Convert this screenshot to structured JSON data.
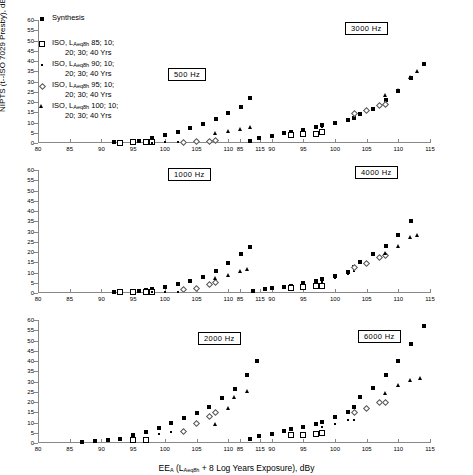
{
  "figure": {
    "ylabel": "NIPTS (t--ISO 7029 Presby), dB",
    "xlabel_main": "EE",
    "xlabel_sub_a": "A",
    "xlabel_rest": " (L",
    "xlabel_sub_b": "Aeq8h",
    "xlabel_tail": " + 8 Log Years Exposure), dBy"
  },
  "legend": {
    "items": [
      {
        "marker": "filled-square",
        "line1": "Synthesis",
        "line2": ""
      },
      {
        "marker": "open-square",
        "line1_pre": "ISO,  L",
        "line1_sub": "Aeq8h",
        "line1_post": "  85;  10;",
        "line2": "20;  30;  40  Yrs"
      },
      {
        "marker": "small-dot",
        "line1_pre": "ISO,  L",
        "line1_sub": "Aeq8h",
        "line1_post": "  90;  10;",
        "line2": "20;  30;  40  Yrs"
      },
      {
        "marker": "open-diamond",
        "line1_pre": "ISO,  L",
        "line1_sub": "Aeq8h",
        "line1_post": "  95;  10;",
        "line2": "20;  30;  40  Yrs"
      },
      {
        "marker": "filled-triangle",
        "line1_pre": "ISO,  L",
        "line1_sub": "Aeq8h",
        "line1_post": "  100;  10;",
        "line2": "20;  30;  40  Yrs"
      }
    ]
  },
  "chart_data": {
    "type": "scatter",
    "title": "",
    "xlabel": "EE_A (L_Aeq8h + 8 Log Years Exposure), dBy",
    "ylabel": "NIPTS (t--ISO 7029 Presby), dB",
    "ylim": [
      0,
      60
    ],
    "yticks": [
      0,
      5,
      10,
      15,
      20,
      25,
      30,
      35,
      40,
      45,
      50,
      55,
      60
    ],
    "grid": false,
    "legend_position": "top-left",
    "panels": [
      {
        "label": "500  Hz",
        "row": 0,
        "col": 0,
        "xlim": [
          80,
          115
        ],
        "xticks": [
          80,
          85,
          90,
          95,
          100,
          105,
          110,
          115
        ],
        "series": [
          {
            "name": "Synthesis",
            "marker": "filled-square",
            "x": [
              92,
              93,
              95,
              96,
              97,
              98,
              100,
              102,
              104,
              106,
              108,
              110,
              112,
              113.5
            ],
            "y": [
              0.3,
              0.4,
              0.6,
              0.8,
              1.2,
              2.6,
              3.8,
              5.3,
              7.2,
              9.2,
              11.7,
              14.7,
              17.6,
              22.0
            ]
          },
          {
            "name": "ISO 85",
            "marker": "open-square",
            "x": [
              93,
              95,
              97,
              98
            ],
            "y": [
              0.2,
              0.3,
              0.3,
              0.4
            ]
          },
          {
            "name": "ISO 90",
            "marker": "small-dot",
            "x": [
              98,
              100,
              102,
              103,
              105
            ],
            "y": [
              0.2,
              0.3,
              0.3,
              0.4,
              0.4
            ]
          },
          {
            "name": "ISO 95",
            "marker": "open-diamond",
            "x": [
              103,
              105,
              107,
              108
            ],
            "y": [
              0.4,
              0.5,
              0.7,
              1.0
            ]
          },
          {
            "name": "ISO 100",
            "marker": "filled-triangle",
            "x": [
              108,
              110,
              112,
              113.5
            ],
            "y": [
              4.3,
              5.1,
              6.1,
              7.2
            ]
          }
        ]
      },
      {
        "label": "3000  Hz",
        "row": 0,
        "col": 1,
        "xlim": [
          85,
          115
        ],
        "xticks": [
          85,
          90,
          95,
          100,
          105,
          110,
          115
        ],
        "series": [
          {
            "name": "Synthesis",
            "marker": "filled-square",
            "x": [
              86.5,
              88,
              90,
              92,
              93,
              95,
              97,
              98,
              100,
              102,
              103,
              104,
              106,
              108,
              110,
              112,
              114
            ],
            "y": [
              1.2,
              2.3,
              3.6,
              4.7,
              5.2,
              6.4,
              7.6,
              8.7,
              9.8,
              11.0,
              12.0,
              14.2,
              16.8,
              21.2,
              25.3,
              31.7,
              38.4
            ]
          },
          {
            "name": "ISO 85",
            "marker": "open-square",
            "x": [
              93,
              95,
              97,
              98
            ],
            "y": [
              3.7,
              4.3,
              4.6,
              5.2
            ]
          },
          {
            "name": "ISO 90",
            "marker": "small-dot",
            "x": [
              98,
              100,
              102,
              103
            ],
            "y": [
              7.8,
              9.6,
              11.0,
              12.0
            ]
          },
          {
            "name": "ISO 95",
            "marker": "open-diamond",
            "x": [
              103,
              105,
              107,
              108
            ],
            "y": [
              14.5,
              16.0,
              18.5,
              19.0
            ]
          },
          {
            "name": "ISO 100",
            "marker": "filled-triangle",
            "x": [
              108,
              110,
              112,
              113
            ],
            "y": [
              22.5,
              25.0,
              31.5,
              34.5
            ]
          }
        ]
      },
      {
        "label": "1000  Hz",
        "row": 1,
        "col": 0,
        "xlim": [
          80,
          115
        ],
        "xticks": [
          80,
          85,
          90,
          95,
          100,
          105,
          110,
          115
        ],
        "series": [
          {
            "name": "Synthesis",
            "marker": "filled-square",
            "x": [
              92,
              93,
              95,
              96,
              97,
              98,
              100,
              102,
              104,
              106,
              108,
              110,
              112,
              113.5
            ],
            "y": [
              0.3,
              0.5,
              0.7,
              1.0,
              1.4,
              2.0,
              3.0,
              4.3,
              6.0,
              8.0,
              10.5,
              14.5,
              19.2,
              22.5
            ]
          },
          {
            "name": "ISO 85",
            "marker": "open-square",
            "x": [
              93,
              95,
              97,
              98
            ],
            "y": [
              0.3,
              0.4,
              0.5,
              0.6
            ]
          },
          {
            "name": "ISO 90",
            "marker": "small-dot",
            "x": [
              98,
              100,
              102,
              103
            ],
            "y": [
              0.4,
              0.5,
              0.6,
              0.8
            ]
          },
          {
            "name": "ISO 95",
            "marker": "open-diamond",
            "x": [
              103,
              105,
              107,
              108
            ],
            "y": [
              1.6,
              2.0,
              4.2,
              5.2
            ]
          },
          {
            "name": "ISO 100",
            "marker": "filled-triangle",
            "x": [
              108,
              110,
              112,
              113
            ],
            "y": [
              6.6,
              8.2,
              10.0,
              11.0
            ]
          }
        ]
      },
      {
        "label": "4000  Hz",
        "row": 1,
        "col": 1,
        "xlim": [
          85,
          115
        ],
        "xticks": [
          85,
          90,
          95,
          100,
          105,
          110,
          115
        ],
        "series": [
          {
            "name": "Synthesis",
            "marker": "filled-square",
            "x": [
              87,
              89,
              90,
              92,
              93,
              95,
              97,
              98,
              100,
              102,
              103,
              104,
              106,
              108,
              110,
              112
            ],
            "y": [
              1.0,
              1.8,
              2.4,
              3.0,
              3.4,
              4.8,
              5.8,
              7.0,
              8.2,
              10.4,
              12.5,
              15.0,
              18.8,
              23.0,
              28.2,
              35.3
            ]
          },
          {
            "name": "ISO 85",
            "marker": "open-square",
            "x": [
              93,
              95,
              97,
              98
            ],
            "y": [
              2.4,
              2.8,
              3.2,
              3.4
            ]
          },
          {
            "name": "ISO 90",
            "marker": "small-dot",
            "x": [
              98,
              100,
              102,
              103
            ],
            "y": [
              5.5,
              7.5,
              9.4,
              10.5
            ]
          },
          {
            "name": "ISO 95",
            "marker": "open-diamond",
            "x": [
              103,
              105,
              107,
              108
            ],
            "y": [
              12.2,
              14.5,
              17.5,
              18.3
            ]
          },
          {
            "name": "ISO 100",
            "marker": "filled-triangle",
            "x": [
              108,
              110,
              112,
              113
            ],
            "y": [
              18.8,
              22.2,
              26.5,
              27.5
            ]
          }
        ]
      },
      {
        "label": "2000  Hz",
        "row": 2,
        "col": 0,
        "xlim": [
          80,
          115
        ],
        "xticks": [
          80,
          85,
          90,
          95,
          100,
          105,
          110,
          115
        ],
        "series": [
          {
            "name": "Synthesis",
            "marker": "filled-square",
            "x": [
              87,
              89,
              91,
              93,
              95,
              97,
              99,
              101,
              103,
              105,
              107,
              109,
              111,
              113,
              114.5
            ],
            "y": [
              0.4,
              0.8,
              1.4,
              2.1,
              3.8,
              5.4,
              7.4,
              9.6,
              12.0,
              14.8,
              17.6,
              22.1,
              26.4,
              33.0,
              39.8
            ]
          },
          {
            "name": "ISO 85",
            "marker": "open-square",
            "x": [
              95,
              97
            ],
            "y": [
              1.3,
              1.6
            ]
          },
          {
            "name": "ISO 90",
            "marker": "small-dot",
            "x": [
              99,
              101,
              103
            ],
            "y": [
              4.6,
              5.6,
              6.2
            ]
          },
          {
            "name": "ISO 95",
            "marker": "open-diamond",
            "x": [
              103,
              105,
              107,
              108
            ],
            "y": [
              5.8,
              9.6,
              12.8,
              14.8
            ]
          },
          {
            "name": "ISO 100",
            "marker": "filled-triangle",
            "x": [
              108,
              110,
              111,
              113
            ],
            "y": [
              8.4,
              16.6,
              21.6,
              24.7
            ]
          }
        ]
      },
      {
        "label": "6000  Hz",
        "row": 2,
        "col": 1,
        "xlim": [
          85,
          115
        ],
        "xticks": [
          85,
          90,
          95,
          100,
          105,
          110,
          115
        ],
        "series": [
          {
            "name": "Synthesis",
            "marker": "filled-square",
            "x": [
              86.5,
              88,
              90,
              92,
              93,
              95,
              97,
              98,
              100,
              102,
              103,
              104,
              106,
              108,
              110,
              112,
              114
            ],
            "y": [
              2.0,
              3.4,
              4.6,
              6.0,
              6.6,
              7.8,
              9.1,
              10.2,
              12.5,
              15.0,
              17.8,
              22.6,
              26.8,
              33.3,
              40.0,
              48.3,
              57.3
            ]
          },
          {
            "name": "ISO 85",
            "marker": "open-square",
            "x": [
              93,
              95,
              97,
              98
            ],
            "y": [
              4.0,
              4.0,
              4.2,
              4.9
            ]
          },
          {
            "name": "ISO 90",
            "marker": "small-dot",
            "x": [
              98,
              100,
              102,
              103
            ],
            "y": [
              8.0,
              9.3,
              11.1,
              11.4
            ]
          },
          {
            "name": "ISO 95",
            "marker": "open-diamond",
            "x": [
              103,
              105,
              107,
              108
            ],
            "y": [
              14.7,
              17.0,
              19.6,
              20.0
            ]
          },
          {
            "name": "ISO 100",
            "marker": "filled-triangle",
            "x": [
              108,
              110,
              112,
              113.5
            ],
            "y": [
              23.9,
              27.8,
              30.1,
              31.0
            ]
          }
        ]
      }
    ]
  }
}
